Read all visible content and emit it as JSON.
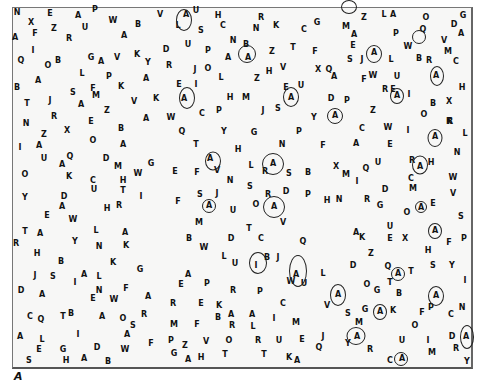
{
  "caption": "A",
  "target_letter": "A",
  "letters": [
    [
      "N",
      16,
      12
    ],
    [
      "E",
      49,
      13
    ],
    [
      "A",
      77,
      15
    ],
    [
      "P",
      94,
      9
    ],
    [
      "W",
      112,
      20
    ],
    [
      "B",
      137,
      24
    ],
    [
      "V",
      159,
      14
    ],
    [
      "X",
      30,
      22
    ],
    [
      "Z",
      53,
      28
    ],
    [
      "U",
      84,
      27
    ],
    [
      "A",
      14,
      37
    ],
    [
      "F",
      34,
      33
    ],
    [
      "R",
      68,
      38
    ],
    [
      "A",
      123,
      35
    ],
    [
      "I",
      32,
      50
    ],
    [
      "Q",
      20,
      60
    ],
    [
      "O",
      47,
      65
    ],
    [
      "B",
      57,
      60
    ],
    [
      "G",
      90,
      57
    ],
    [
      "A",
      100,
      61
    ],
    [
      "V",
      116,
      57
    ],
    [
      "K",
      136,
      54
    ],
    [
      "Y",
      147,
      62
    ],
    [
      "L",
      81,
      73
    ],
    [
      "P",
      108,
      76
    ],
    [
      "A",
      145,
      78
    ],
    [
      "A",
      37,
      80
    ],
    [
      "B",
      16,
      87
    ],
    [
      "K",
      120,
      86
    ],
    [
      "F",
      92,
      88
    ],
    [
      "S",
      72,
      92
    ],
    [
      "M",
      95,
      95
    ],
    [
      "T",
      26,
      103
    ],
    [
      "J",
      49,
      100
    ],
    [
      "A",
      80,
      104
    ],
    [
      "V",
      133,
      101
    ],
    [
      "K",
      155,
      98
    ],
    [
      "Z",
      106,
      110
    ],
    [
      "R",
      53,
      116
    ],
    [
      "A",
      145,
      118
    ],
    [
      "N",
      25,
      123
    ],
    [
      "E",
      90,
      121
    ],
    [
      "B",
      120,
      128
    ],
    [
      "Z",
      43,
      134
    ],
    [
      "X",
      66,
      130
    ],
    [
      "O",
      92,
      140
    ],
    [
      "A",
      122,
      144
    ],
    [
      "I",
      19,
      147
    ],
    [
      "A",
      38,
      145
    ],
    [
      "U",
      43,
      158
    ],
    [
      "Q",
      69,
      156
    ],
    [
      "A",
      61,
      164
    ],
    [
      "D",
      105,
      158
    ],
    [
      "M",
      117,
      166
    ],
    [
      "G",
      150,
      163
    ],
    [
      "W",
      137,
      173
    ],
    [
      "O",
      24,
      174
    ],
    [
      "K",
      68,
      176
    ],
    [
      "C",
      92,
      180
    ],
    [
      "H",
      122,
      180
    ],
    [
      "U",
      93,
      189
    ],
    [
      "T",
      122,
      190
    ],
    [
      "Y",
      24,
      197
    ],
    [
      "D",
      63,
      196
    ],
    [
      "I",
      140,
      196
    ],
    [
      "A",
      61,
      206
    ],
    [
      "H",
      106,
      208
    ],
    [
      "R",
      118,
      205
    ],
    [
      "E",
      46,
      215
    ],
    [
      "W",
      72,
      219
    ],
    [
      "T",
      24,
      231
    ],
    [
      "A",
      39,
      233
    ],
    [
      "L",
      95,
      230
    ],
    [
      "A",
      124,
      232
    ],
    [
      "R",
      15,
      243
    ],
    [
      "Y",
      74,
      241
    ],
    [
      "N",
      98,
      246
    ],
    [
      "K",
      125,
      245
    ],
    [
      "H",
      36,
      253
    ],
    [
      "B",
      60,
      261
    ],
    [
      "K",
      112,
      262
    ],
    [
      "J",
      34,
      275
    ],
    [
      "S",
      52,
      276
    ],
    [
      "A",
      83,
      274
    ],
    [
      "L",
      98,
      276
    ],
    [
      "I",
      74,
      282
    ],
    [
      "G",
      139,
      269
    ],
    [
      "D",
      20,
      290
    ],
    [
      "A",
      41,
      294
    ],
    [
      "N",
      98,
      290
    ],
    [
      "F",
      125,
      288
    ],
    [
      "E",
      92,
      298
    ],
    [
      "W",
      113,
      299
    ],
    [
      "A",
      147,
      296
    ],
    [
      "C",
      29,
      316
    ],
    [
      "Q",
      40,
      319
    ],
    [
      "T",
      62,
      316
    ],
    [
      "B",
      70,
      313
    ],
    [
      "A",
      101,
      316
    ],
    [
      "O",
      122,
      318
    ],
    [
      "R",
      143,
      314
    ],
    [
      "S",
      132,
      325
    ],
    [
      "A",
      19,
      336
    ],
    [
      "L",
      41,
      339
    ],
    [
      "I",
      77,
      334
    ],
    [
      "A",
      126,
      334
    ],
    [
      "E",
      38,
      349
    ],
    [
      "G",
      62,
      349
    ],
    [
      "D",
      96,
      347
    ],
    [
      "W",
      124,
      349
    ],
    [
      "F",
      150,
      343
    ],
    [
      "S",
      28,
      360
    ],
    [
      "H",
      65,
      360
    ],
    [
      "A",
      83,
      358
    ],
    [
      "B",
      107,
      361
    ],
    [
      "A",
      185,
      14
    ],
    [
      "U",
      195,
      10
    ],
    [
      "H",
      217,
      15
    ],
    [
      "R",
      260,
      17
    ],
    [
      "K",
      275,
      25
    ],
    [
      "C",
      303,
      29
    ],
    [
      "L",
      177,
      25
    ],
    [
      "S",
      200,
      30
    ],
    [
      "C",
      222,
      25
    ],
    [
      "N",
      255,
      28
    ],
    [
      "G",
      316,
      22
    ],
    [
      "D",
      165,
      49
    ],
    [
      "U",
      187,
      44
    ],
    [
      "N",
      232,
      40
    ],
    [
      "B",
      245,
      44
    ],
    [
      "P",
      207,
      50
    ],
    [
      "A",
      227,
      57
    ],
    [
      "A",
      247,
      57
    ],
    [
      "Z",
      271,
      51
    ],
    [
      "T",
      292,
      47
    ],
    [
      "F",
      314,
      51
    ],
    [
      "R",
      168,
      65
    ],
    [
      "J",
      194,
      69
    ],
    [
      "O",
      207,
      68
    ],
    [
      "L",
      220,
      77
    ],
    [
      "Z",
      256,
      78
    ],
    [
      "H",
      268,
      71
    ],
    [
      "V",
      282,
      67
    ],
    [
      "X",
      317,
      69
    ],
    [
      "E",
      178,
      84
    ],
    [
      "I",
      195,
      84
    ],
    [
      "A",
      183,
      98
    ],
    [
      "H",
      229,
      97
    ],
    [
      "M",
      245,
      97
    ],
    [
      "E",
      285,
      87
    ],
    [
      "U",
      300,
      85
    ],
    [
      "A",
      290,
      97
    ],
    [
      "W",
      170,
      117
    ],
    [
      "C",
      201,
      113
    ],
    [
      "P",
      218,
      110
    ],
    [
      "J",
      262,
      110
    ],
    [
      "S",
      277,
      108
    ],
    [
      "Y",
      313,
      117
    ],
    [
      "Q",
      181,
      131
    ],
    [
      "Y",
      223,
      131
    ],
    [
      "G",
      253,
      132
    ],
    [
      "P",
      298,
      131
    ],
    [
      "T",
      195,
      144
    ],
    [
      "H",
      237,
      149
    ],
    [
      "N",
      281,
      144
    ],
    [
      "A",
      209,
      158
    ],
    [
      "L",
      250,
      165
    ],
    [
      "A",
      272,
      163
    ],
    [
      "R",
      264,
      171
    ],
    [
      "S",
      288,
      173
    ],
    [
      "B",
      307,
      172
    ],
    [
      "E",
      174,
      171
    ],
    [
      "F",
      196,
      172
    ],
    [
      "V",
      216,
      170
    ],
    [
      "N",
      229,
      180
    ],
    [
      "S",
      249,
      186
    ],
    [
      "S",
      199,
      194
    ],
    [
      "J",
      216,
      193
    ],
    [
      "A",
      208,
      205
    ],
    [
      "F",
      177,
      201
    ],
    [
      "U",
      232,
      210
    ],
    [
      "R",
      267,
      194
    ],
    [
      "D",
      285,
      191
    ],
    [
      "P",
      307,
      194
    ],
    [
      "O",
      255,
      204
    ],
    [
      "A",
      273,
      206
    ],
    [
      "M",
      198,
      222
    ],
    [
      "T",
      248,
      228
    ],
    [
      "V",
      282,
      222
    ],
    [
      "B",
      188,
      238
    ],
    [
      "D",
      230,
      238
    ],
    [
      "C",
      260,
      238
    ],
    [
      "Q",
      302,
      241
    ],
    [
      "W",
      203,
      247
    ],
    [
      "L",
      223,
      256
    ],
    [
      "U",
      234,
      263
    ],
    [
      "I",
      255,
      265
    ],
    [
      "B",
      266,
      257
    ],
    [
      "J",
      277,
      257
    ],
    [
      "A",
      295,
      274
    ],
    [
      "W",
      290,
      281
    ],
    [
      "U",
      303,
      283
    ],
    [
      "A",
      187,
      274
    ],
    [
      "E",
      180,
      284
    ],
    [
      "P",
      206,
      283
    ],
    [
      "R",
      232,
      290
    ],
    [
      "P",
      259,
      291
    ],
    [
      "R",
      172,
      303
    ],
    [
      "E",
      200,
      303
    ],
    [
      "K",
      218,
      305
    ],
    [
      "C",
      282,
      303
    ],
    [
      "B",
      217,
      317
    ],
    [
      "A",
      230,
      314
    ],
    [
      "A",
      251,
      314
    ],
    [
      "I",
      273,
      318
    ],
    [
      "M",
      295,
      322
    ],
    [
      "R",
      231,
      325
    ],
    [
      "L",
      252,
      326
    ],
    [
      "M",
      173,
      324
    ],
    [
      "F",
      196,
      324
    ],
    [
      "P",
      170,
      340
    ],
    [
      "Z",
      184,
      345
    ],
    [
      "V",
      205,
      341
    ],
    [
      "O",
      228,
      340
    ],
    [
      "R",
      257,
      340
    ],
    [
      "U",
      278,
      340
    ],
    [
      "E",
      301,
      339
    ],
    [
      "G",
      173,
      353
    ],
    [
      "A",
      187,
      359
    ],
    [
      "H",
      200,
      357
    ],
    [
      "T",
      224,
      354
    ],
    [
      "T",
      263,
      354
    ],
    [
      "K",
      288,
      357
    ],
    [
      "A",
      296,
      360
    ],
    [
      "Z",
      363,
      17
    ],
    [
      "L",
      383,
      14
    ],
    [
      "A",
      392,
      14
    ],
    [
      "O",
      425,
      17
    ],
    [
      "G",
      462,
      15
    ],
    [
      "M",
      345,
      26
    ],
    [
      "A",
      353,
      34
    ],
    [
      "P",
      395,
      33
    ],
    [
      "Q",
      422,
      29
    ],
    [
      "D",
      453,
      24
    ],
    [
      "A",
      460,
      33
    ],
    [
      "E",
      352,
      45
    ],
    [
      "W",
      407,
      46
    ],
    [
      "V",
      443,
      40
    ],
    [
      "M",
      447,
      51
    ],
    [
      "S",
      349,
      59
    ],
    [
      "J",
      361,
      59
    ],
    [
      "A",
      373,
      52
    ],
    [
      "L",
      390,
      59
    ],
    [
      "B",
      418,
      58
    ],
    [
      "R",
      428,
      60
    ],
    [
      "C",
      455,
      61
    ],
    [
      "Q",
      328,
      69
    ],
    [
      "A",
      333,
      76
    ],
    [
      "F",
      363,
      79
    ],
    [
      "W",
      372,
      75
    ],
    [
      "U",
      396,
      76
    ],
    [
      "A",
      435,
      75
    ],
    [
      "H",
      461,
      87
    ],
    [
      "R",
      384,
      89
    ],
    [
      "E",
      392,
      89
    ],
    [
      "A",
      396,
      95
    ],
    [
      "I",
      408,
      94
    ],
    [
      "D",
      330,
      98
    ],
    [
      "P",
      346,
      100
    ],
    [
      "Z",
      372,
      110
    ],
    [
      "B",
      432,
      103
    ],
    [
      "X",
      448,
      101
    ],
    [
      "A",
      334,
      115
    ],
    [
      "O",
      423,
      114
    ],
    [
      "K",
      448,
      121
    ],
    [
      "C",
      361,
      128
    ],
    [
      "W",
      387,
      127
    ],
    [
      "I",
      407,
      130
    ],
    [
      "R",
      449,
      121
    ],
    [
      "A",
      434,
      136
    ],
    [
      "L",
      464,
      133
    ],
    [
      "F",
      322,
      145
    ],
    [
      "A",
      355,
      143
    ],
    [
      "E",
      389,
      144
    ],
    [
      "N",
      456,
      152
    ],
    [
      "X",
      335,
      166
    ],
    [
      "U",
      377,
      162
    ],
    [
      "Q",
      365,
      168
    ],
    [
      "R",
      411,
      160
    ],
    [
      "A",
      419,
      166
    ],
    [
      "H",
      430,
      162
    ],
    [
      "M",
      345,
      174
    ],
    [
      "I",
      356,
      181
    ],
    [
      "C",
      410,
      178
    ],
    [
      "W",
      452,
      177
    ],
    [
      "D",
      384,
      189
    ],
    [
      "M",
      412,
      188
    ],
    [
      "V",
      452,
      193
    ],
    [
      "H",
      326,
      200
    ],
    [
      "N",
      338,
      199
    ],
    [
      "R",
      366,
      199
    ],
    [
      "G",
      379,
      205
    ],
    [
      "A",
      420,
      207
    ],
    [
      "E",
      432,
      203
    ],
    [
      "O",
      406,
      212
    ],
    [
      "S",
      460,
      216
    ],
    [
      "U",
      389,
      226
    ],
    [
      "A",
      355,
      232
    ],
    [
      "K",
      361,
      237
    ],
    [
      "E",
      389,
      238
    ],
    [
      "X",
      404,
      238
    ],
    [
      "A",
      434,
      230
    ],
    [
      "F",
      448,
      242
    ],
    [
      "P",
      463,
      238
    ],
    [
      "H",
      427,
      250
    ],
    [
      "Z",
      370,
      253
    ],
    [
      "S",
      432,
      265
    ],
    [
      "Y",
      451,
      265
    ],
    [
      "D",
      352,
      265
    ],
    [
      "Q",
      387,
      266
    ],
    [
      "A",
      397,
      273
    ],
    [
      "T",
      410,
      271
    ],
    [
      "L",
      322,
      273
    ],
    [
      "I",
      464,
      280
    ],
    [
      "O",
      366,
      284
    ],
    [
      "G",
      376,
      290
    ],
    [
      "T",
      389,
      282
    ],
    [
      "B",
      398,
      293
    ],
    [
      "A",
      337,
      294
    ],
    [
      "A",
      435,
      295
    ],
    [
      "V",
      326,
      305
    ],
    [
      "S",
      347,
      313
    ],
    [
      "G",
      364,
      309
    ],
    [
      "A",
      379,
      311
    ],
    [
      "K",
      392,
      310
    ],
    [
      "F",
      421,
      312
    ],
    [
      "P",
      430,
      307
    ],
    [
      "C",
      450,
      314
    ],
    [
      "N",
      461,
      307
    ],
    [
      "M",
      358,
      322
    ],
    [
      "O",
      414,
      325
    ],
    [
      "A",
      356,
      336
    ],
    [
      "D",
      451,
      336
    ],
    [
      "A",
      465,
      336
    ],
    [
      "U",
      401,
      340
    ],
    [
      "I",
      427,
      340
    ],
    [
      "J",
      322,
      336
    ],
    [
      "Y",
      347,
      343
    ],
    [
      "R",
      369,
      349
    ],
    [
      "Q",
      318,
      347
    ],
    [
      "R",
      455,
      348
    ],
    [
      "M",
      431,
      352
    ],
    [
      "C",
      389,
      360
    ],
    [
      "A",
      401,
      358
    ],
    [
      "Y",
      466,
      361
    ]
  ],
  "circled": [
    [
      183,
      19,
      14,
      20
    ],
    [
      246,
      53,
      16,
      16
    ],
    [
      186,
      97,
      14,
      20
    ],
    [
      418,
      36,
      12,
      12
    ],
    [
      373,
      53,
      14,
      16
    ],
    [
      290,
      96,
      14,
      18
    ],
    [
      436,
      75,
      12,
      18
    ],
    [
      334,
      115,
      14,
      14
    ],
    [
      396,
      95,
      12,
      14
    ],
    [
      212,
      160,
      14,
      17
    ],
    [
      272,
      163,
      20,
      20
    ],
    [
      434,
      137,
      13,
      16
    ],
    [
      419,
      164,
      14,
      17
    ],
    [
      208,
      205,
      12,
      12
    ],
    [
      273,
      206,
      20,
      20
    ],
    [
      420,
      206,
      10,
      10
    ],
    [
      434,
      230,
      12,
      14
    ],
    [
      337,
      294,
      14,
      20
    ],
    [
      297,
      270,
      16,
      30
    ],
    [
      397,
      273,
      12,
      12
    ],
    [
      435,
      295,
      14,
      18
    ],
    [
      379,
      311,
      12,
      14
    ],
    [
      355,
      335,
      17,
      16
    ],
    [
      466,
      336,
      12,
      22
    ],
    [
      400,
      358,
      12,
      12
    ],
    [
      257,
      262,
      16,
      20
    ],
    [
      348,
      6,
      14,
      12
    ]
  ]
}
